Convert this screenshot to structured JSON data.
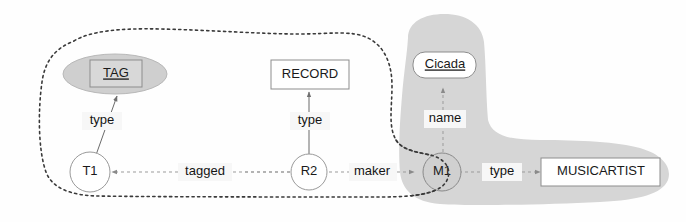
{
  "diagram": {
    "nodes": {
      "tag_class": {
        "label": "TAG",
        "shape": "rect-in-ellipse",
        "underlined": true
      },
      "record_class": {
        "label": "RECORD",
        "shape": "rect",
        "underlined": false
      },
      "cicada_literal": {
        "label": "Cicada",
        "shape": "rounded-rect",
        "underlined": true
      },
      "t1": {
        "label": "T1",
        "shape": "circle"
      },
      "r2": {
        "label": "R2",
        "shape": "circle"
      },
      "m1": {
        "label": "M1",
        "shape": "circle"
      },
      "musicartist_class": {
        "label": "MUSICARTIST",
        "shape": "rect",
        "underlined": false
      }
    },
    "edges": {
      "t1_type_tag": {
        "label": "type"
      },
      "r2_type_record": {
        "label": "type"
      },
      "r2_tagged_t1": {
        "label": "tagged"
      },
      "r2_maker_m1": {
        "label": "maker"
      },
      "m1_name_cicada": {
        "label": "name"
      },
      "m1_type_musicartist": {
        "label": "type"
      }
    },
    "regions": {
      "dashed_boundary": {
        "name": "dashed-region",
        "style": "dashed"
      },
      "gray_region": {
        "name": "gray-region",
        "style": "filled",
        "color": "#d6d6d6"
      }
    },
    "colors": {
      "gray_fill": "#d6d6d6",
      "ellipse_fill": "#cfcfcf",
      "dash_stroke": "#3a3a3a",
      "edge_stroke": "#6a6a6a",
      "text": "#1a1a1a"
    }
  }
}
